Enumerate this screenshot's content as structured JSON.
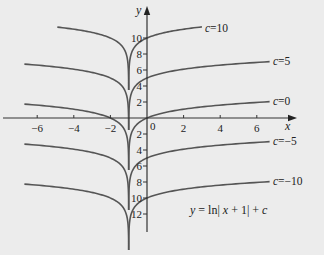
{
  "chart_data": {
    "type": "line",
    "title": "",
    "formula": "y = ln| x + 1| + c",
    "xlabel": "x",
    "ylabel": "y",
    "xlim": [
      -7.9,
      8
    ],
    "ylim": [
      -14.2,
      13.8
    ],
    "x_ticks": [
      -6,
      -4,
      -2,
      0,
      2,
      4,
      6
    ],
    "x_tick_labels": [
      "−6",
      "−4",
      "−2",
      "0",
      "2",
      "4",
      "6"
    ],
    "y_ticks": [
      10,
      8,
      6,
      4,
      2,
      -2,
      -4,
      -6,
      -8,
      -10,
      -12
    ],
    "y_tick_labels": [
      "10",
      "8",
      "6",
      "4",
      "2",
      "2",
      "4",
      "6",
      "8",
      "10",
      "12"
    ],
    "asymptote_x": -1,
    "grid": false,
    "series": [
      {
        "name": "c=10",
        "c": 10,
        "x_range": [
          -4.9,
          3.0
        ],
        "label": "c=10"
      },
      {
        "name": "c=5",
        "c": 5,
        "x_range": [
          -6.7,
          6.7
        ],
        "label": "c=5"
      },
      {
        "name": "c=0",
        "c": 0,
        "x_range": [
          -6.7,
          6.7
        ],
        "label": "c=0"
      },
      {
        "name": "c=-5",
        "c": -5,
        "x_range": [
          -6.7,
          6.7
        ],
        "label": "c=−5"
      },
      {
        "name": "c=-10",
        "c": -10,
        "x_range": [
          -6.7,
          6.7
        ],
        "label": "c=−10"
      }
    ],
    "sample_points": {
      "c=10": [
        [
          -4.9,
          11.36
        ],
        [
          -3,
          10.69
        ],
        [
          -2,
          10.0
        ],
        [
          0,
          10.0
        ],
        [
          1,
          10.69
        ],
        [
          3,
          11.39
        ]
      ],
      "c=5": [
        [
          -6.7,
          6.74
        ],
        [
          -4,
          6.1
        ],
        [
          -2,
          5.0
        ],
        [
          0,
          5.0
        ],
        [
          2,
          6.1
        ],
        [
          6.7,
          7.04
        ]
      ],
      "c=0": [
        [
          -6.7,
          1.74
        ],
        [
          -4,
          1.1
        ],
        [
          -2,
          0.0
        ],
        [
          0,
          0.0
        ],
        [
          2,
          1.1
        ],
        [
          6.7,
          2.04
        ]
      ],
      "c=-5": [
        [
          -6.7,
          -3.26
        ],
        [
          -4,
          -3.9
        ],
        [
          -2,
          -5.0
        ],
        [
          0,
          -5.0
        ],
        [
          2,
          -3.9
        ],
        [
          6.7,
          -2.96
        ]
      ],
      "c=-10": [
        [
          -6.7,
          -8.26
        ],
        [
          -4,
          -8.9
        ],
        [
          -2,
          -10.0
        ],
        [
          0,
          -10.0
        ],
        [
          2,
          -8.9
        ],
        [
          6.7,
          -7.96
        ]
      ]
    },
    "colors": {
      "curve": "#555555",
      "axis": "#333333",
      "background": "#ececec"
    }
  },
  "view": {
    "origin_px": [
      147,
      118
    ],
    "px_per_x": 18.3,
    "px_per_y": 8.0,
    "x_axis_px": [
      3,
      297
    ],
    "y_axis_px": [
      232,
      6
    ],
    "cusp_depth": 6.5,
    "label_offsets": {
      "c=10": [
        205,
        32
      ],
      "c=5": [
        273,
        65
      ],
      "c=0": [
        273,
        105
      ],
      "c=-5": [
        273,
        145
      ],
      "c=-10": [
        273,
        185
      ]
    },
    "formula_pos": [
      190,
      214
    ],
    "xlabel_pos": [
      285,
      130
    ],
    "ylabel_pos": [
      136,
      14
    ]
  }
}
